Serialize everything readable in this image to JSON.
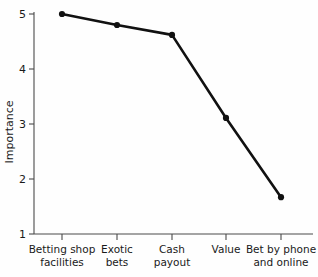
{
  "chart_data": {
    "type": "line",
    "title": "",
    "subtitle": "",
    "xlabel": "",
    "ylabel": "Importance",
    "categories": [
      "Betting shop facilities",
      "Exotic bets",
      "Cash payout",
      "Value",
      "Bet by phone and online"
    ],
    "category_lines": [
      [
        "Betting shop",
        "facilities"
      ],
      [
        "Exotic",
        "bets"
      ],
      [
        "Cash",
        "payout"
      ],
      [
        "Value",
        ""
      ],
      [
        "Bet by phone",
        "and online"
      ]
    ],
    "values": [
      5.0,
      4.8,
      4.62,
      3.11,
      1.67
    ],
    "series": [
      {
        "name": "Importance",
        "values": [
          5.0,
          4.8,
          4.62,
          3.11,
          1.67
        ]
      }
    ],
    "ylim": [
      1,
      5
    ],
    "yticks": [
      1,
      2,
      3,
      4,
      5
    ],
    "ytick_labels": [
      "1",
      "2",
      "3",
      "4",
      "5"
    ],
    "grid": false,
    "legend": false,
    "legend_position": "none",
    "marker": "filled-circle",
    "line_color": "#111111",
    "marker_color": "#111111",
    "axis_color": "#4a4a4a",
    "background_color": "#fefefe"
  },
  "axis": {
    "y_label": "Importance",
    "tick_1": "1",
    "tick_2": "2",
    "tick_3": "3",
    "tick_4": "4",
    "tick_5": "5"
  },
  "categories": {
    "c0_l1": "Betting shop",
    "c0_l2": "facilities",
    "c1_l1": "Exotic",
    "c1_l2": "bets",
    "c2_l1": "Cash",
    "c2_l2": "payout",
    "c3_l1": "Value",
    "c3_l2": "",
    "c4_l1": "Bet by phone",
    "c4_l2": "and online"
  }
}
